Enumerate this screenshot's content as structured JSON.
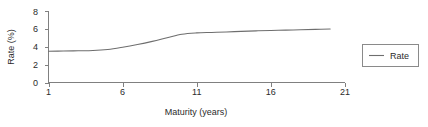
{
  "chart_data": {
    "type": "line",
    "title": "",
    "xlabel": "Maturity (years)",
    "ylabel": "Rate (%)",
    "xlim": [
      1,
      21
    ],
    "ylim": [
      0,
      8
    ],
    "xticks": [
      1,
      6,
      11,
      16,
      21
    ],
    "yticks": [
      0,
      2,
      4,
      6,
      8
    ],
    "xtick_labels": [
      "1",
      "6",
      "11",
      "16",
      "21"
    ],
    "ytick_labels": [
      "0",
      "2",
      "4",
      "6",
      "8"
    ],
    "grid": false,
    "legend_position": "right",
    "legend_entries": [
      "Rate"
    ],
    "line_color": "#6e6e6e",
    "axis_color": "#808080",
    "series": [
      {
        "name": "Rate",
        "x": [
          1,
          2,
          3,
          4,
          5,
          6,
          7,
          8,
          9,
          10,
          11,
          12,
          13,
          14,
          15,
          16,
          17,
          18,
          19,
          20
        ],
        "values": [
          3.5,
          3.52,
          3.55,
          3.58,
          3.7,
          3.95,
          4.25,
          4.6,
          5.0,
          5.4,
          5.55,
          5.6,
          5.65,
          5.72,
          5.78,
          5.82,
          5.86,
          5.9,
          5.94,
          5.98
        ]
      }
    ]
  },
  "legend": {
    "label": "Rate"
  },
  "axes": {
    "x_title": "Maturity (years)",
    "y_title": "Rate (%)"
  }
}
